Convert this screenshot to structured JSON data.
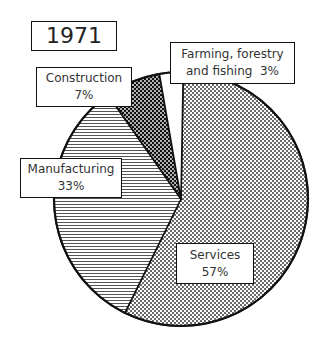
{
  "chart_data": {
    "type": "pie",
    "title": "1971",
    "categories": [
      "Services",
      "Manufacturing",
      "Construction",
      "Farming, forestry and fishing"
    ],
    "values": [
      57,
      33,
      7,
      3
    ],
    "unit": "%",
    "start_angle_deg": 0,
    "direction": "clockwise",
    "fills": [
      "light-dots",
      "horizontal-lines",
      "dense-dark-dots",
      "white"
    ],
    "labels": [
      {
        "name": "Services",
        "value": "57%"
      },
      {
        "name": "Manufacturing",
        "value": "33%"
      },
      {
        "name": "Construction",
        "value": "7%"
      },
      {
        "name": "Farming, forestry and fishing",
        "value": "3%"
      }
    ]
  },
  "title": "1971",
  "labels": {
    "services": {
      "line1": "Services",
      "line2": "57%"
    },
    "manufacturing": {
      "line1": "Manufacturing",
      "line2": "33%"
    },
    "construction": {
      "line1": "Construction",
      "line2": "7%"
    },
    "farming": {
      "line1": "Farming, forestry",
      "line2": "and fishing  3%"
    }
  }
}
